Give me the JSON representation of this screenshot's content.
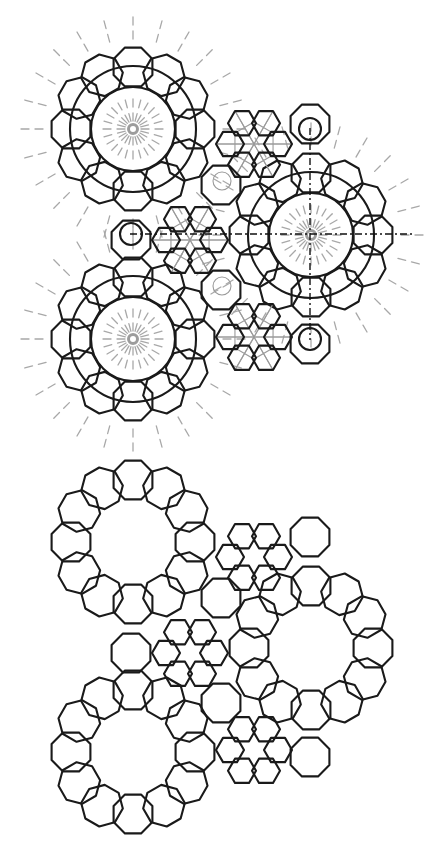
{
  "figures": {
    "construction": {
      "label": "Construction drawing with guide lines",
      "offset_y": 0,
      "center_y_shift": -413,
      "show_guides": true
    },
    "pattern": {
      "label": "Final interlaced pattern",
      "offset_y": 0,
      "show_guides": false
    }
  },
  "geometry": {
    "rosettes": [
      {
        "name": "rosette-upper-left",
        "cx": 133,
        "cy": 542,
        "ring_radius": 62,
        "count": 12,
        "octagon_radius": 21
      },
      {
        "name": "rosette-right",
        "cx": 311,
        "cy": 648,
        "ring_radius": 62,
        "count": 12,
        "octagon_radius": 21
      },
      {
        "name": "rosette-lower-left",
        "cx": 133,
        "cy": 752,
        "ring_radius": 62,
        "count": 12,
        "octagon_radius": 21
      }
    ],
    "hex_clusters": [
      {
        "name": "hex-cluster-top",
        "cx": 254,
        "cy": 557,
        "ring_radius": 24,
        "count": 6,
        "hex_radius": 14
      },
      {
        "name": "hex-cluster-middle",
        "cx": 190,
        "cy": 653,
        "ring_radius": 24,
        "count": 6,
        "hex_radius": 14
      },
      {
        "name": "hex-cluster-bottom",
        "cx": 254,
        "cy": 750,
        "ring_radius": 24,
        "count": 6,
        "hex_radius": 14
      }
    ],
    "lone_octagons": [
      {
        "name": "octagon-top-right",
        "cx": 310,
        "cy": 537,
        "r": 21
      },
      {
        "name": "octagon-left",
        "cx": 131,
        "cy": 653,
        "r": 21
      },
      {
        "name": "octagon-inner-top",
        "cx": 221,
        "cy": 598,
        "r": 21
      },
      {
        "name": "octagon-inner-bottom",
        "cx": 221,
        "cy": 703,
        "r": 21
      },
      {
        "name": "octagon-bottom-right",
        "cx": 310,
        "cy": 757,
        "r": 21
      }
    ]
  },
  "guides": {
    "horizontal_axis": {
      "x1": 130,
      "x2": 414,
      "y": 234
    },
    "vertical_axis": {
      "x": 310,
      "y1": 128,
      "y2": 340
    },
    "small_circles": [
      {
        "cx": 131,
        "cy": 234,
        "r": 11
      },
      {
        "cx": 310,
        "cy": 129,
        "r": 11
      },
      {
        "cx": 310,
        "cy": 339,
        "r": 11
      },
      {
        "cx": 222,
        "cy": 181,
        "r": 9
      },
      {
        "cx": 222,
        "cy": 286,
        "r": 9
      }
    ],
    "colors": {
      "ink": "#1a1a1a",
      "guide": "#9a9a9a"
    }
  }
}
